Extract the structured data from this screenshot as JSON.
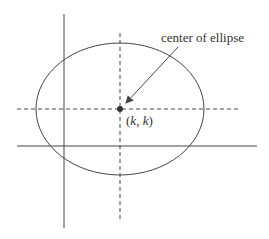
{
  "diagram": {
    "title_label": "center of ellipse",
    "center_label_open": "(",
    "center_label_k1": "k",
    "center_label_sep": ", ",
    "center_label_k2": "k",
    "center_label_close": ")",
    "colors": {
      "stroke": "#444444",
      "text": "#333333",
      "background": "#ffffff"
    },
    "elements": [
      "x-axis",
      "y-axis",
      "ellipse",
      "dashed horizontal line through center",
      "dashed vertical line through center",
      "center point",
      "arrow to center"
    ]
  }
}
